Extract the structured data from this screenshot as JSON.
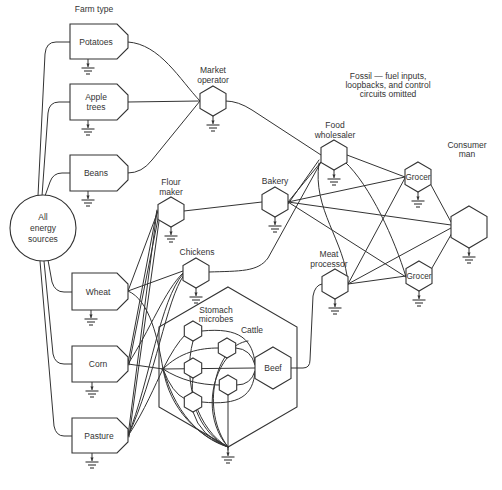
{
  "diagram": {
    "farm_type_label": "Farm type",
    "omission_note": [
      "Fossil — fuel inputs,",
      "loopbacks, and control",
      "circuits omitted"
    ],
    "energy_source": {
      "lines": [
        "All",
        "energy",
        "sources"
      ]
    },
    "farms": {
      "potatoes": [
        "Potatoes"
      ],
      "apple_trees": [
        "Apple",
        "trees"
      ],
      "beans": [
        "Beans"
      ],
      "wheat": [
        "Wheat"
      ],
      "corn": [
        "Corn"
      ],
      "pasture": [
        "Pasture"
      ]
    },
    "processors": {
      "market_operator": [
        "Market",
        "operator"
      ],
      "flour_maker": [
        "Flour",
        "maker"
      ],
      "bakery": [
        "Bakery"
      ],
      "chickens": [
        "Chickens"
      ],
      "food_wholesaler": [
        "Food",
        "wholesaler"
      ],
      "meat_processor": [
        "Meat",
        "processor"
      ],
      "grocer_upper": [
        "Grocer"
      ],
      "grocer_lower": [
        "Grocer"
      ],
      "consumer": [
        "Consumer",
        "man"
      ]
    },
    "cattle": {
      "label": "Cattle",
      "microbes_label": [
        "Stomach",
        "microbes"
      ],
      "microbe_count": 5,
      "beef": "Beef"
    },
    "connections": [
      {
        "from": "All energy sources",
        "to": "Potatoes"
      },
      {
        "from": "All energy sources",
        "to": "Apple trees"
      },
      {
        "from": "All energy sources",
        "to": "Beans"
      },
      {
        "from": "All energy sources",
        "to": "Wheat"
      },
      {
        "from": "All energy sources",
        "to": "Corn"
      },
      {
        "from": "All energy sources",
        "to": "Pasture"
      },
      {
        "from": "Potatoes",
        "to": "Market operator"
      },
      {
        "from": "Apple trees",
        "to": "Market operator"
      },
      {
        "from": "Beans",
        "to": "Market operator"
      },
      {
        "from": "Market operator",
        "to": "Food wholesaler"
      },
      {
        "from": "Wheat",
        "to": "Flour maker"
      },
      {
        "from": "Wheat",
        "to": "Chickens"
      },
      {
        "from": "Wheat",
        "to": "Cattle"
      },
      {
        "from": "Corn",
        "to": "Flour maker"
      },
      {
        "from": "Corn",
        "to": "Chickens"
      },
      {
        "from": "Corn",
        "to": "Cattle"
      },
      {
        "from": "Pasture",
        "to": "Flour maker"
      },
      {
        "from": "Pasture",
        "to": "Chickens"
      },
      {
        "from": "Pasture",
        "to": "Cattle"
      },
      {
        "from": "Flour maker",
        "to": "Bakery"
      },
      {
        "from": "Chickens",
        "to": "Food wholesaler"
      },
      {
        "from": "Cattle",
        "to": "Beef"
      },
      {
        "from": "Beef",
        "to": "Meat processor"
      },
      {
        "from": "Bakery",
        "to": "Food wholesaler"
      },
      {
        "from": "Bakery",
        "to": "Grocer"
      },
      {
        "from": "Bakery",
        "to": "Consumer man"
      },
      {
        "from": "Food wholesaler",
        "to": "Grocer"
      },
      {
        "from": "Food wholesaler",
        "to": "Meat processor"
      },
      {
        "from": "Meat processor",
        "to": "Grocer"
      },
      {
        "from": "Meat processor",
        "to": "Consumer man"
      },
      {
        "from": "Grocer",
        "to": "Consumer man"
      }
    ],
    "colors": {
      "line": "#333333",
      "text": "#333333",
      "background": "#ffffff"
    }
  }
}
